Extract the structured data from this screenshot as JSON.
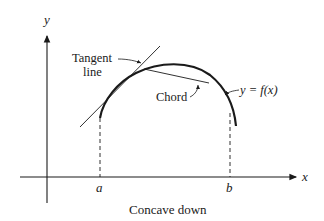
{
  "diagram": {
    "caption": "Concave down",
    "axes": {
      "x_label": "x",
      "y_label": "y"
    },
    "labels": {
      "tangent_line_1": "Tangent",
      "tangent_line_2": "line",
      "chord": "Chord",
      "function": "y = f(x)",
      "a": "a",
      "b": "b"
    },
    "colors": {
      "ink": "#1a1a1a",
      "background": "#ffffff"
    }
  }
}
